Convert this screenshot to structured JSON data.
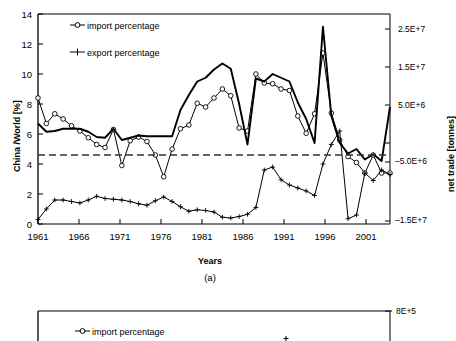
{
  "figure": {
    "caption_a": "(a)"
  },
  "panel_a": {
    "xlabel": "Years",
    "ylabel_left": "China /World [%]",
    "ylabel_right": "net trade [tonnes]",
    "legend": [
      {
        "label": "import percentage",
        "marker": "open-circle"
      },
      {
        "label": "export percentage",
        "marker": "plus"
      }
    ],
    "yticks_left": [
      "0",
      "2",
      "4",
      "6",
      "8",
      "10",
      "12",
      "14"
    ],
    "yticks_right": [
      "2.5E+7",
      "1.5E+7",
      "5.0E+6",
      "–5.0E+6",
      "–1.5E+7"
    ],
    "xticks": [
      "1961",
      "1966",
      "1971",
      "1976",
      "1981",
      "1986",
      "1991",
      "1996",
      "2001"
    ]
  },
  "panel_b": {
    "legend": [
      {
        "label": "import percentage",
        "marker": "open-circle"
      }
    ],
    "yticks_right": [
      "8E+5"
    ]
  },
  "chart_data": {
    "type": "line",
    "title": "",
    "subtitle": "",
    "xlabel": "Years",
    "ylabel": "China /World [%]",
    "ylabel_secondary": "net trade [tonnes]",
    "grid": false,
    "legend_position": "upper-left-inside",
    "xlim": [
      1961,
      2003
    ],
    "ylim": [
      0,
      14
    ],
    "ylim_secondary": [
      -15000000,
      30000000
    ],
    "xticks": [
      1961,
      1966,
      1971,
      1976,
      1981,
      1986,
      1991,
      1996,
      2001
    ],
    "yticks": [
      0,
      2,
      4,
      6,
      8,
      10,
      12,
      14
    ],
    "yticks_secondary": [
      25000000,
      15000000,
      5000000,
      -5000000,
      -15000000
    ],
    "yticklabels_secondary": [
      "2.5E+7",
      "1.5E+7",
      "5.0E+6",
      "–5.0E+6",
      "–1.5E+7"
    ],
    "x": [
      1961,
      1962,
      1963,
      1964,
      1965,
      1966,
      1967,
      1968,
      1969,
      1970,
      1971,
      1972,
      1973,
      1974,
      1975,
      1976,
      1977,
      1978,
      1979,
      1980,
      1981,
      1982,
      1983,
      1984,
      1985,
      1986,
      1987,
      1988,
      1989,
      1990,
      1991,
      1992,
      1993,
      1994,
      1995,
      1996,
      1997,
      1998,
      1999,
      2000,
      2001,
      2002,
      2003
    ],
    "series": [
      {
        "name": "import percentage",
        "axis": "left",
        "marker": "open-circle",
        "linestyle": "solid",
        "values": [
          8.4,
          6.7,
          7.35,
          7.0,
          6.55,
          6.2,
          5.75,
          5.3,
          5.1,
          6.3,
          3.9,
          5.55,
          5.8,
          5.5,
          4.6,
          3.15,
          5.0,
          6.35,
          6.6,
          8.05,
          7.8,
          8.4,
          9.0,
          8.55,
          6.4,
          6.2,
          10.0,
          9.4,
          9.35,
          9.0,
          8.9,
          7.2,
          6.05,
          7.35,
          11.4,
          7.4,
          5.6,
          4.5,
          4.1,
          3.4,
          4.6,
          3.4,
          3.4
        ]
      },
      {
        "name": "export percentage",
        "axis": "left",
        "marker": "plus",
        "linestyle": "solid",
        "values": [
          0.3,
          1.0,
          1.6,
          1.6,
          1.5,
          1.4,
          1.6,
          1.85,
          1.7,
          1.65,
          1.6,
          1.5,
          1.35,
          1.25,
          1.55,
          1.8,
          1.5,
          1.15,
          0.85,
          0.95,
          0.9,
          0.8,
          0.45,
          0.4,
          0.5,
          0.65,
          1.1,
          3.6,
          3.8,
          2.95,
          2.6,
          2.4,
          2.2,
          1.9,
          4.0,
          5.3,
          6.2,
          0.35,
          0.6,
          3.4,
          2.9,
          3.6,
          3.3
        ]
      },
      {
        "name": "net trade",
        "axis": "right",
        "marker": "none",
        "linestyle": "solid-thick",
        "values": [
          6.7,
          6.15,
          6.2,
          6.35,
          6.35,
          6.35,
          6.15,
          5.8,
          5.75,
          6.35,
          5.6,
          5.75,
          5.9,
          5.85,
          5.85,
          5.85,
          5.85,
          7.6,
          8.6,
          9.5,
          9.75,
          10.3,
          10.7,
          10.35,
          8.0,
          5.3,
          9.7,
          9.5,
          10.0,
          9.75,
          9.5,
          8.1,
          7.0,
          5.4,
          13.15,
          7.2,
          5.4,
          4.7,
          5.0,
          4.3,
          4.65,
          4.2,
          7.8
        ]
      },
      {
        "name": "reference line",
        "axis": "left",
        "marker": "none",
        "linestyle": "dashed",
        "constant": 4.6
      }
    ]
  }
}
